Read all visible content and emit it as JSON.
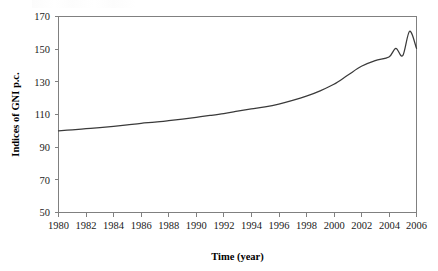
{
  "figure": {
    "background_color": "#ffffff",
    "line_color": "#3a3a3a",
    "axis_color": "#808080",
    "text_color": "#1a1a1a"
  },
  "chart_data": {
    "type": "line",
    "title": "",
    "subtitle": "",
    "xlabel": "Time (year)",
    "ylabel": "Indices of GNI p.c.",
    "xlim": [
      1980,
      2006
    ],
    "ylim": [
      50,
      170
    ],
    "xticks": [
      1980,
      1982,
      1984,
      1986,
      1988,
      1990,
      1992,
      1994,
      1996,
      1998,
      2000,
      2002,
      2004,
      2006
    ],
    "yticks": [
      50,
      70,
      90,
      110,
      130,
      150,
      170
    ],
    "xtick_labels": [
      "1980",
      "1982",
      "1984",
      "1986",
      "1988",
      "1990",
      "1992",
      "1994",
      "1996",
      "1998",
      "2000",
      "2002",
      "2004",
      "2006"
    ],
    "ytick_labels": [
      "50",
      "70",
      "90",
      "110",
      "130",
      "150",
      "170"
    ],
    "grid": false,
    "legend": false,
    "legend_position": "none",
    "annotations": [],
    "series": [
      {
        "name": "Indices of GNI p.c.",
        "color": "#3a3a3a",
        "x": [
          1980,
          1981,
          1982,
          1983,
          1984,
          1985,
          1986,
          1987,
          1988,
          1989,
          1990,
          1991,
          1992,
          1993,
          1994,
          1995,
          1996,
          1997,
          1998,
          1999,
          2000,
          2001,
          2002,
          2003,
          2004,
          2005,
          2006
        ],
        "values": [
          100.0,
          100.6,
          101.3,
          102.0,
          102.8,
          103.7,
          104.6,
          105.3,
          106.2,
          107.2,
          108.3,
          109.4,
          110.6,
          112.0,
          113.4,
          114.7,
          116.4,
          118.6,
          121.2,
          124.5,
          128.5,
          134.0,
          139.5,
          143.0,
          145.2,
          146.0,
          150.5
        ]
      }
    ],
    "series_extra_points": {
      "note": "smooth continuation to end of axis",
      "x": [
        2004.5,
        2005,
        2005.5,
        2006
      ],
      "values": [
        150.5,
        157.0,
        161.0,
        163.0
      ]
    }
  },
  "axes": {
    "x_axis_title": "Time (year)",
    "y_axis_title": "Indices of GNI p.c."
  }
}
